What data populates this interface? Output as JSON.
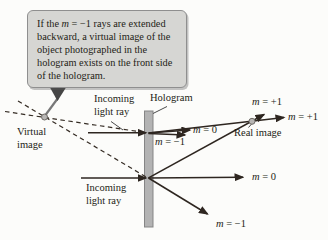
{
  "colors": {
    "ray": "#2e2620",
    "dashed_ray": "#352c24",
    "callout_fill": "#d6d6d3",
    "callout_border": "#8f8f8f",
    "hologram_fill": "#b3b3b3",
    "hologram_edge": "#858585",
    "image_dot_fill": "#b8b6b4",
    "image_dot_edge": "#6e6a66",
    "tail_line": "#787878",
    "tail_triangle": "#454545",
    "background": "#fcfcfa"
  },
  "callout": {
    "line1": {
      "pre": "If the ",
      "sym": "m",
      "post": " = −1 rays are extended"
    },
    "lines": [
      "backward, a virtual image of the",
      "object photographed in the",
      "hologram exists on the front side",
      "of the hologram."
    ]
  },
  "labels": {
    "virtual_image": "Virtual image",
    "incoming_top": "Incoming light ray",
    "hologram": "Hologram",
    "incoming_bottom": "Incoming light ray",
    "real_image": "Real image",
    "orders": {
      "m0_top": {
        "sym": "m",
        "rest": " = 0"
      },
      "m_minus1_top": {
        "sym": "m",
        "rest": " = −1"
      },
      "m_plus1_top": {
        "sym": "m",
        "rest": " = +1"
      },
      "m_plus1_right": {
        "sym": "m",
        "rest": " = +1"
      },
      "m0_bottom": {
        "sym": "m",
        "rest": " = 0"
      },
      "m_minus1_bottom": {
        "sym": "m",
        "rest": " = −1"
      }
    }
  }
}
